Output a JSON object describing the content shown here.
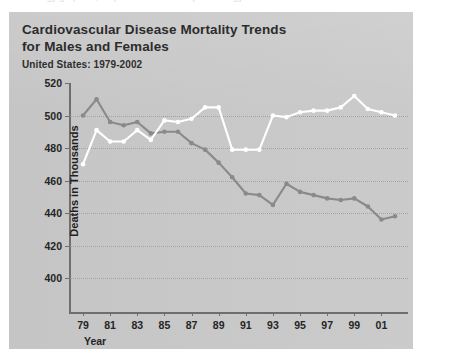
{
  "clipped_top_text": "ology graphics, maps and charts for epidemiology",
  "header": {
    "title_line1": "Cardiovascular Disease Mortality Trends",
    "title_line2": "for Males and Females",
    "subtitle": "United States: 1979-2002"
  },
  "colors": {
    "panel_background": "#c9c9c9",
    "page_background": "#ffffff",
    "axis": "#6e6e6e",
    "gridline": "#9d9d9d",
    "series_females": "#ffffff",
    "series_males": "#8a8a8a",
    "text": "#252525"
  },
  "chart_data": {
    "type": "line",
    "title": "Cardiovascular Disease Mortality Trends for Males and Females",
    "subtitle": "United States: 1979-2002",
    "xlabel": "Year",
    "ylabel": "Deaths in Thousands",
    "xlim": [
      1979,
      2002
    ],
    "ylim": [
      400,
      520
    ],
    "yticks": [
      400,
      420,
      440,
      460,
      480,
      500,
      520
    ],
    "grid": true,
    "legend_position": "none",
    "x": [
      1979,
      1980,
      1981,
      1982,
      1983,
      1984,
      1985,
      1986,
      1987,
      1988,
      1989,
      1990,
      1991,
      1992,
      1993,
      1994,
      1995,
      1996,
      1997,
      1998,
      1999,
      2000,
      2001,
      2002
    ],
    "xtick_labels": [
      "79",
      "81",
      "83",
      "85",
      "87",
      "89",
      "91",
      "93",
      "95",
      "97",
      "99",
      "01"
    ],
    "xtick_values": [
      1979,
      1981,
      1983,
      1985,
      1987,
      1989,
      1991,
      1993,
      1995,
      1997,
      1999,
      2001
    ],
    "series": [
      {
        "name": "Males",
        "color": "#8a8a8a",
        "values": [
          500,
          510,
          496,
          494,
          496,
          489,
          490,
          490,
          483,
          479,
          471,
          462,
          452,
          451,
          445,
          458,
          453,
          451,
          449,
          448,
          449,
          444,
          436,
          438
        ]
      },
      {
        "name": "Females",
        "color": "#ffffff",
        "values": [
          470,
          491,
          484,
          484,
          491,
          485,
          497,
          496,
          498,
          505,
          505,
          479,
          479,
          479,
          500,
          499,
          502,
          503,
          503,
          505,
          512,
          504,
          502,
          500
        ]
      }
    ]
  }
}
